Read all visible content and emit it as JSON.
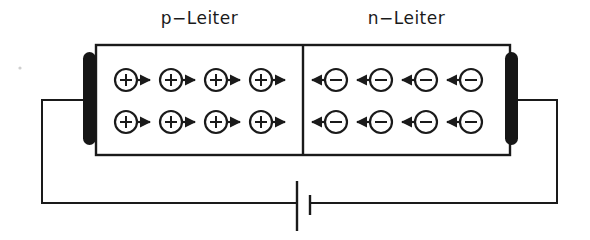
{
  "figure": {
    "title_labels": {
      "p_region": "p−Leiter",
      "n_region": "n−Leiter"
    },
    "colors": {
      "ink": "#1a1a1a",
      "electrode_fill": "#161616",
      "background": "#ffffff"
    }
  },
  "regions": [
    {
      "id": "p-region",
      "label": "p−Leiter",
      "carrier_symbol": "+",
      "carrier_name": "hole",
      "arrow_direction": "right",
      "rows": 2,
      "carriers_per_row": 4
    },
    {
      "id": "n-region",
      "label": "n−Leiter",
      "carrier_symbol": "−",
      "carrier_name": "electron",
      "arrow_direction": "left",
      "rows": 2,
      "carriers_per_row": 4
    }
  ],
  "electrodes": [
    {
      "id": "left-electrode",
      "side": "left"
    },
    {
      "id": "right-electrode",
      "side": "right"
    }
  ],
  "battery": {
    "name": "battery-cell",
    "long_plate_side": "left",
    "short_plate_side": "right"
  },
  "circuit": {
    "wire_name": "circuit-wire"
  }
}
